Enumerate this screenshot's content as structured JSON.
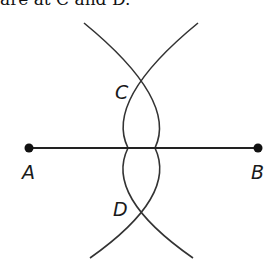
{
  "caption": {
    "text": "are at C and D."
  },
  "diagram": {
    "type": "perpendicular bisector construction",
    "segment": {
      "from": "A",
      "to": "B"
    },
    "points": {
      "A": {
        "label": "A",
        "x": 29,
        "y": 148
      },
      "B": {
        "label": "B",
        "x": 258,
        "y": 148
      },
      "C": {
        "label": "C",
        "x": 138,
        "y": 86
      },
      "D": {
        "label": "D",
        "x": 138,
        "y": 210
      }
    },
    "arcs": [
      {
        "center": "A",
        "description": "arc from A intersecting at C and D"
      },
      {
        "center": "B",
        "description": "arc from B intersecting at C and D"
      }
    ],
    "colors": {
      "stroke": "#333333",
      "point": "#111111",
      "background": "#ffffff"
    }
  }
}
